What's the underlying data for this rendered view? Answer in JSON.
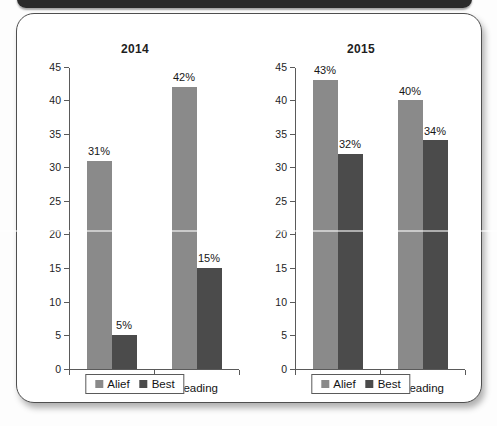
{
  "document": {
    "type": "scanned-page",
    "top_bar_present": true
  },
  "colors": {
    "series_alief": "#8a8a8a",
    "series_best": "#4b4b4b",
    "axis": "#5a5a5a",
    "card_border": "#4f4f4f",
    "page_background": "#fdfdfd"
  },
  "chart_data": [
    {
      "type": "bar",
      "title": "2014",
      "categories": [
        "Math",
        "Reading"
      ],
      "series": [
        {
          "name": "Alief",
          "values": [
            31,
            42
          ],
          "labels": [
            "31%",
            "42%"
          ]
        },
        {
          "name": "Best",
          "values": [
            5,
            15
          ],
          "labels": [
            "5%",
            "15%"
          ]
        }
      ],
      "xlabel": "",
      "ylabel": "",
      "ylim": [
        0,
        45
      ],
      "yticks": [
        0,
        5,
        10,
        15,
        20,
        25,
        30,
        35,
        40,
        45
      ],
      "ytick_labels": [
        "0",
        "5",
        "10",
        "15",
        "20",
        "25",
        "30",
        "35",
        "40",
        "45"
      ],
      "grid": false,
      "legend": {
        "position": "bottom",
        "entries": [
          "Alief",
          "Best"
        ]
      }
    },
    {
      "type": "bar",
      "title": "2015",
      "categories": [
        "Math",
        "Reading"
      ],
      "series": [
        {
          "name": "Alief",
          "values": [
            43,
            40
          ],
          "labels": [
            "43%",
            "40%"
          ]
        },
        {
          "name": "Best",
          "values": [
            32,
            34
          ],
          "labels": [
            "32%",
            "34%"
          ]
        }
      ],
      "xlabel": "",
      "ylabel": "",
      "ylim": [
        0,
        45
      ],
      "yticks": [
        0,
        5,
        10,
        15,
        20,
        25,
        30,
        35,
        40,
        45
      ],
      "ytick_labels": [
        "0",
        "5",
        "10",
        "15",
        "20",
        "25",
        "30",
        "35",
        "40",
        "45"
      ],
      "grid": false,
      "legend": {
        "position": "bottom",
        "entries": [
          "Alief",
          "Best"
        ]
      }
    }
  ]
}
